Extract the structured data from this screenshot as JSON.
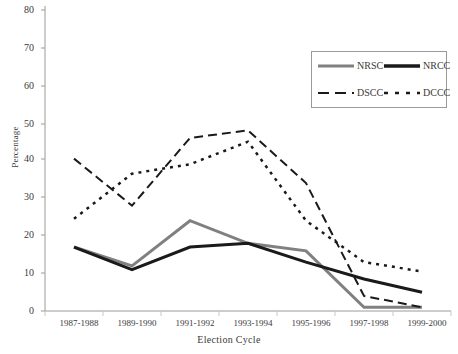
{
  "chart_data": {
    "type": "line",
    "title": "",
    "xlabel": "Election Cycle",
    "ylabel": "Percentage",
    "categories": [
      "1987-1988",
      "1989-1990",
      "1991-1992",
      "1993-1994",
      "1995-1996",
      "1997-1998",
      "1999-2000"
    ],
    "ylim": [
      0,
      80
    ],
    "yticks": [
      0,
      10,
      20,
      30,
      40,
      50,
      60,
      70,
      80
    ],
    "grid": false,
    "legend_position": "upper right",
    "series": [
      {
        "name": "NRSC",
        "style": "solid",
        "color": "#808080",
        "values": [
          17,
          12,
          24,
          18,
          16,
          1,
          1
        ]
      },
      {
        "name": "NRCC",
        "style": "solid",
        "color": "#1a1a1a",
        "values": [
          17,
          11,
          17,
          18,
          13,
          8.5,
          5
        ]
      },
      {
        "name": "DSCC",
        "style": "dashed",
        "color": "#1a1a1a",
        "values": [
          40.5,
          28,
          46,
          48,
          34,
          4,
          1
        ]
      },
      {
        "name": "DCCC",
        "style": "dotted",
        "color": "#1a1a1a",
        "values": [
          24.5,
          36.5,
          39,
          45,
          24,
          13,
          10.5
        ]
      }
    ]
  },
  "axis": {
    "ytick_labels": [
      "80",
      "70",
      "60",
      "50",
      "40",
      "30",
      "20",
      "10",
      "0"
    ],
    "ylabel": "Percentage",
    "xlabel": "Election Cycle"
  },
  "legend": {
    "entries": [
      {
        "label": "NRSC"
      },
      {
        "label": "NRCC"
      },
      {
        "label": "DSCC"
      },
      {
        "label": "DCCC"
      }
    ]
  }
}
